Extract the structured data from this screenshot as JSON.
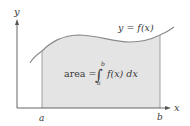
{
  "diagram": {
    "curve_label": "y = f(x)",
    "y_axis_label": "y",
    "x_axis_label": "x",
    "lower_limit_label": "a",
    "upper_limit_label": "b",
    "formula": {
      "lhs": "area =",
      "integral_symbol": "∫",
      "upper": "b",
      "lower": "a",
      "integrand": "f(x) dx"
    },
    "colors": {
      "shade": "#e4e4e4",
      "curve": "#8a8a8a",
      "axis": "#555555",
      "text": "#3a3a3a"
    }
  }
}
